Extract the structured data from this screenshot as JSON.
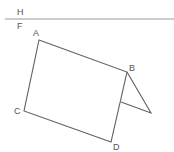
{
  "diagram": {
    "type": "geometry-projection",
    "labels": {
      "H": "H",
      "F": "F",
      "A": "A",
      "B": "B",
      "C": "C",
      "D": "D"
    },
    "colors": {
      "line": "#606060",
      "ground_line": "#9a9a9a",
      "label": "#555555",
      "background": "#ffffff"
    },
    "points": {
      "A": [
        39,
        40
      ],
      "B": [
        127,
        72
      ],
      "C": [
        24,
        111
      ],
      "D": [
        111,
        142
      ],
      "E": [
        151,
        113
      ],
      "G": [
        121,
        102
      ]
    },
    "ground_line": {
      "y": 19,
      "x1": 5,
      "x2": 174
    }
  }
}
